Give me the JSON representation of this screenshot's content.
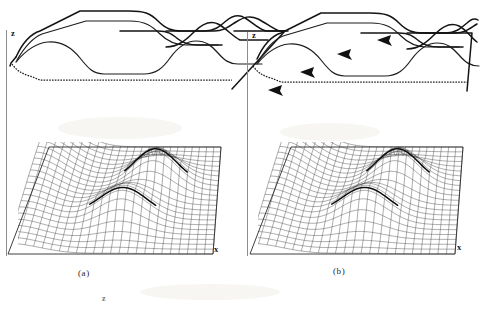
{
  "figure": {
    "background_color": "#ffffff",
    "ink_color": "#141414",
    "width": 481,
    "height": 309
  },
  "panels": [
    {
      "id": "panel-a",
      "caption": "(a)",
      "axes": {
        "vertical_label": "z",
        "horizontal_label": "x"
      },
      "has_direction_arrows": false,
      "arrow_count": 0,
      "profile": {
        "curve_count": 4,
        "solid_curves": 3,
        "dotted_curves": 1,
        "note": "stacked wavy profile traces with one dotted baseline"
      },
      "mesh": {
        "type": "wireframe-surface",
        "grid_rows": 22,
        "grid_cols": 24,
        "peak_count": 2,
        "ridge_highlighted": true
      }
    },
    {
      "id": "panel-b",
      "caption": "(b)",
      "axes": {
        "vertical_label": "z",
        "horizontal_label": "x"
      },
      "has_direction_arrows": true,
      "arrow_count": 4,
      "profile": {
        "curve_count": 4,
        "solid_curves": 3,
        "dotted_curves": 1,
        "note": "same profile traces as panel (a) with leftward direction arrowheads"
      },
      "mesh": {
        "type": "wireframe-surface",
        "grid_rows": 22,
        "grid_cols": 24,
        "peak_count": 2,
        "ridge_highlighted": true
      }
    }
  ],
  "stray_marks": [
    {
      "text": "z",
      "note": "faint stray glyph below the (a) caption"
    }
  ],
  "chart_data": {
    "type": "line",
    "title": "",
    "xlabel": "x",
    "ylabel": "z",
    "legend": [],
    "grid": false,
    "xlim": [
      0,
      1
    ],
    "ylim": [
      0,
      1
    ],
    "series": [
      {
        "name": "profile-top",
        "style": "solid",
        "x": [
          0.0,
          0.08,
          0.16,
          0.26,
          0.34,
          0.4,
          0.48,
          0.56,
          0.62,
          0.7,
          0.78,
          0.86,
          0.94,
          1.0
        ],
        "values": [
          0.52,
          0.78,
          0.92,
          0.92,
          0.9,
          0.76,
          0.66,
          0.64,
          0.64,
          0.72,
          0.8,
          0.74,
          0.66,
          0.64
        ]
      },
      {
        "name": "profile-second",
        "style": "solid",
        "x": [
          0.0,
          0.08,
          0.16,
          0.26,
          0.34,
          0.42,
          0.5,
          0.58,
          0.66,
          0.74,
          0.82,
          0.9,
          1.0
        ],
        "values": [
          0.5,
          0.72,
          0.8,
          0.8,
          0.76,
          0.58,
          0.52,
          0.52,
          0.56,
          0.62,
          0.62,
          0.58,
          0.32
        ]
      },
      {
        "name": "profile-third",
        "style": "solid",
        "x": [
          0.0,
          0.08,
          0.18,
          0.28,
          0.36,
          0.44,
          0.52,
          0.6,
          0.68,
          0.76,
          0.84,
          0.92,
          1.0
        ],
        "values": [
          0.46,
          0.56,
          0.52,
          0.4,
          0.34,
          0.34,
          0.4,
          0.52,
          0.58,
          0.52,
          0.42,
          0.4,
          0.4
        ]
      },
      {
        "name": "profile-baseline",
        "style": "dotted",
        "x": [
          0.0,
          0.06,
          0.14,
          0.3,
          0.5,
          0.7,
          0.86,
          1.0
        ],
        "values": [
          0.4,
          0.2,
          0.14,
          0.14,
          0.14,
          0.14,
          0.14,
          0.12
        ]
      }
    ]
  }
}
